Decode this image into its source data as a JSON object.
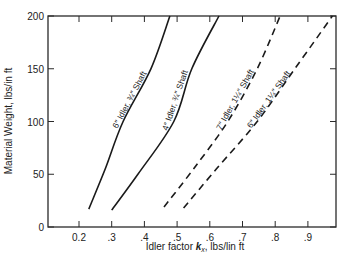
{
  "chart_data": {
    "type": "line",
    "title": "",
    "xlabel": "Idler factor k_x, lbs/lin ft",
    "xlabel_parts": {
      "prefix": "Idler factor ",
      "symbol": "k",
      "subscript": "x",
      "suffix": ", lbs/lin ft"
    },
    "ylabel": "Material Weight, lbs/in ft",
    "xlim": [
      0.105,
      0.985
    ],
    "ylim": [
      0,
      200
    ],
    "grid": false,
    "legend": "inline curve labels",
    "x_ticks": [
      {
        "value": 0.2,
        "label": "0.2"
      },
      {
        "value": 0.3,
        "label": ".3"
      },
      {
        "value": 0.4,
        "label": ".4"
      },
      {
        "value": 0.5,
        "label": ".5"
      },
      {
        "value": 0.6,
        "label": ".6"
      },
      {
        "value": 0.7,
        "label": ".7"
      },
      {
        "value": 0.8,
        "label": ".8"
      },
      {
        "value": 0.9,
        "label": ".9"
      }
    ],
    "y_ticks": [
      {
        "value": 0,
        "label": "0"
      },
      {
        "value": 50,
        "label": "50"
      },
      {
        "value": 100,
        "label": "100"
      },
      {
        "value": 150,
        "label": "150"
      },
      {
        "value": 200,
        "label": "200"
      }
    ],
    "series": [
      {
        "name": "6″ Idler, ¾″ Shaft",
        "style": "solid",
        "x": [
          0.23,
          0.28,
          0.335,
          0.42,
          0.478
        ],
        "y": [
          17,
          55,
          100,
          150,
          200
        ]
      },
      {
        "name": "4″ Idler, ¾″ Shaft",
        "style": "solid",
        "x": [
          0.3,
          0.38,
          0.49,
          0.545,
          0.628
        ],
        "y": [
          16,
          50,
          100,
          150,
          200
        ]
      },
      {
        "name": "7″ Idler, 1¼″ Shaft",
        "style": "dashed",
        "x": [
          0.46,
          0.55,
          0.655,
          0.745,
          0.815
        ],
        "y": [
          19,
          55,
          100,
          150,
          200
        ]
      },
      {
        "name": "6″ Idler, 1¼″ Shaft",
        "style": "dashed",
        "x": [
          0.52,
          0.62,
          0.745,
          0.86,
          0.975
        ],
        "y": [
          18,
          55,
          100,
          150,
          200
        ]
      }
    ]
  }
}
